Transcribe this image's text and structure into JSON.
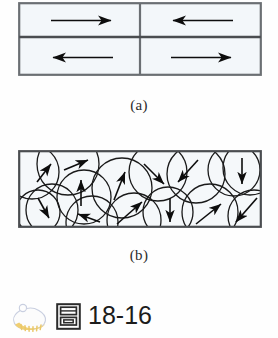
{
  "figure": {
    "number": "18-16",
    "panels": [
      {
        "id": "a",
        "caption": "(a)",
        "description": "Rectangular magnetic domains with aligned arrows",
        "frame": {
          "x": 18,
          "y": 2,
          "width": 244,
          "height": 74
        },
        "dividers": {
          "vertical_x": 122,
          "horizontal_y": 34
        },
        "cells": [
          {
            "name": "domain-top-left",
            "cx": 60,
            "cy": 18,
            "direction": "right",
            "length": 72
          },
          {
            "name": "domain-top-right",
            "cx": 183,
            "cy": 18,
            "direction": "left",
            "length": 72
          },
          {
            "name": "domain-bottom-left",
            "cx": 60,
            "cy": 56,
            "direction": "left",
            "length": 72
          },
          {
            "name": "domain-bottom-right",
            "cx": 183,
            "cy": 56,
            "direction": "right",
            "length": 72
          }
        ]
      },
      {
        "id": "b",
        "caption": "(b)",
        "description": "Randomly oriented circular grains with arrows in many directions",
        "frame": {
          "x": 18,
          "y": 150,
          "width": 244,
          "height": 78
        },
        "grains": [
          {
            "cx": 14,
            "cy": 22,
            "r": 27,
            "angle": -55,
            "len": 22
          },
          {
            "cx": 50,
            "cy": 14,
            "r": 31,
            "angle": -25,
            "len": 26
          },
          {
            "cx": 34,
            "cy": 60,
            "r": 26,
            "angle": 55,
            "len": 22
          },
          {
            "cx": 20,
            "cy": 62,
            "r": 22,
            "angle": 60,
            "len": 20
          },
          {
            "cx": 66,
            "cy": 47,
            "r": 27,
            "angle": -90,
            "len": 26
          },
          {
            "cx": 74,
            "cy": 72,
            "r": 26,
            "angle": 168,
            "len": 24
          },
          {
            "cx": 104,
            "cy": 38,
            "r": 30,
            "angle": -75,
            "len": 30
          },
          {
            "cx": 116,
            "cy": 70,
            "r": 27,
            "angle": -38,
            "len": 27
          },
          {
            "cx": 140,
            "cy": 22,
            "r": 29,
            "angle": 40,
            "len": 26
          },
          {
            "cx": 150,
            "cy": 62,
            "r": 25,
            "angle": 90,
            "len": 24
          },
          {
            "cx": 178,
            "cy": 24,
            "r": 29,
            "angle": 138,
            "len": 27
          },
          {
            "cx": 192,
            "cy": 62,
            "r": 28,
            "angle": -40,
            "len": 27
          },
          {
            "cx": 216,
            "cy": 20,
            "r": 26,
            "angle": 42,
            "len": 24
          },
          {
            "cx": 232,
            "cy": 18,
            "r": 27,
            "angle": 90,
            "len": 26
          },
          {
            "cx": 236,
            "cy": 66,
            "r": 26,
            "angle": 140,
            "len": 25
          }
        ]
      }
    ]
  },
  "bottom_bar": {
    "blob_icon": "highlighter-blob-icon",
    "book_icon": "book-glyph-icon",
    "figure_label": "18-16"
  },
  "colors": {
    "panel_fill": "#f3f7fa",
    "panel_stroke": "#6b6f73",
    "grain_stroke": "#1a1a1a",
    "arrow": "#0d0d0d",
    "text": "#1c1c1c",
    "blob_body": "#fafafa",
    "blob_tip": "#f3d27a",
    "book_dark": "#2b2b2b"
  }
}
